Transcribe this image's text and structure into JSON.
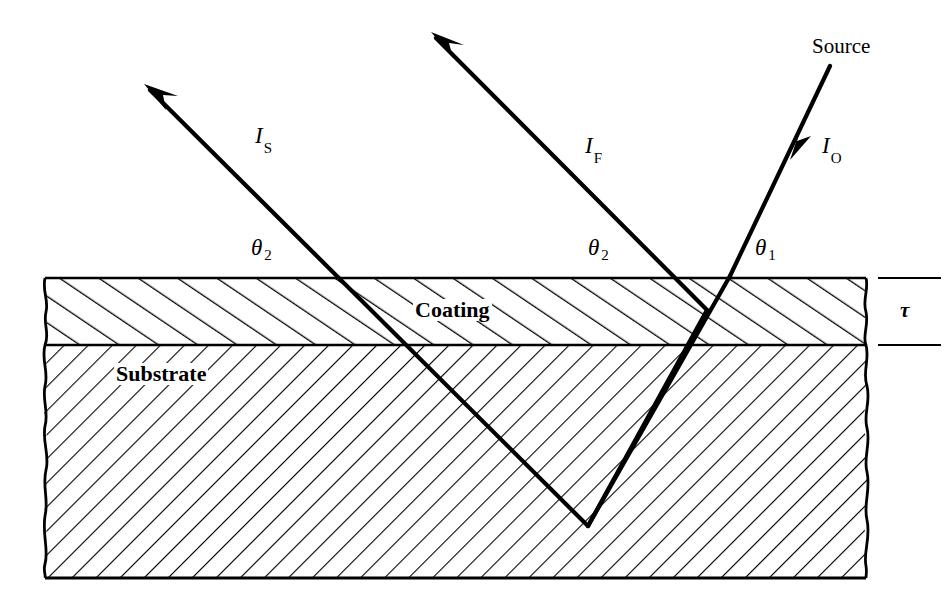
{
  "figure": {
    "background_color": "#ffffff",
    "ink_color": "#000000",
    "width": 952,
    "height": 610
  },
  "labels": {
    "source": "Source",
    "incident_ray": {
      "symbol": "I",
      "subscript": "O",
      "full": "IO"
    },
    "surface_reflected_ray": {
      "symbol": "I",
      "subscript": "S",
      "full": "IS"
    },
    "film_reflected_ray": {
      "symbol": "I",
      "subscript": "F",
      "full": "IF"
    },
    "angle_incidence": {
      "symbol": "θ",
      "subscript": "1",
      "full": "θ1"
    },
    "angle_refraction_left": {
      "symbol": "θ",
      "subscript": "2",
      "full": "θ2"
    },
    "angle_refraction_mid": {
      "symbol": "θ",
      "subscript": "2",
      "full": "θ2"
    },
    "coating_layer": "Coating",
    "substrate_layer": "Substrate",
    "thickness": {
      "symbol": "τ",
      "full": "τ"
    }
  },
  "geometry": {
    "slab": {
      "left_x": 45,
      "right_x": 866,
      "top_y": 278,
      "interface_y": 345,
      "bottom_y": 578,
      "coating_thickness_px": 67,
      "substrate_thickness_px": 233
    },
    "hatching": {
      "coating_direction": "up-right",
      "coating_spacing_px": 22,
      "substrate_direction": "down-right",
      "substrate_spacing_px": 17
    },
    "rays": {
      "incident": {
        "from": [
          828,
          70
        ],
        "to": [
          728,
          278
        ],
        "arrow_at": [
          795,
          150
        ]
      },
      "refracted_in_slab": {
        "from": [
          728,
          278
        ],
        "to": [
          588,
          525
        ]
      },
      "internal_return": {
        "from": [
          588,
          525
        ],
        "to": [
          705,
          312
        ]
      },
      "film_reflected": {
        "from": [
          705,
          312
        ],
        "to": [
          432,
          33
        ]
      },
      "surface_reflected": {
        "from": [
          588,
          525
        ],
        "to": [
          145,
          85
        ]
      }
    },
    "thickness_marker": {
      "tick_top_y": 278,
      "tick_bottom_y": 345,
      "tick_x_start": 878,
      "tick_x_end": 940
    }
  },
  "label_positions": {
    "source": [
      812,
      46
    ],
    "incident_ray": [
      822,
      143
    ],
    "surface_reflected_ray": [
      255,
      133
    ],
    "film_reflected_ray": [
      585,
      143
    ],
    "angle_refraction_left": [
      253,
      245
    ],
    "angle_refraction_mid": [
      590,
      245
    ],
    "angle_incidence": [
      757,
      245
    ],
    "coating_layer": [
      415,
      300
    ],
    "substrate_layer": [
      115,
      363
    ],
    "thickness": [
      902,
      302
    ]
  }
}
